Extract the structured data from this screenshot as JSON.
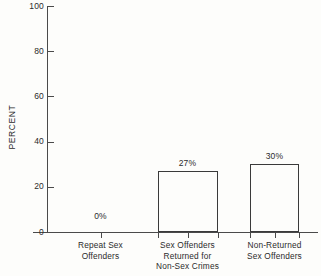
{
  "chart_data": {
    "type": "bar",
    "title": "",
    "subtitle": "",
    "xlabel": "",
    "ylabel": "PERCENT",
    "ylim": [
      0,
      100
    ],
    "yticks": [
      0,
      20,
      40,
      60,
      80,
      100
    ],
    "grid": false,
    "legend": false,
    "categories": [
      "Repeat Sex Offenders",
      "Sex Offenders Returned for Non-Sex Crimes",
      "Non-Returned Sex Offenders"
    ],
    "category_lines": [
      [
        "Repeat Sex",
        "Offenders"
      ],
      [
        "Sex Offenders",
        "Returned for",
        "Non-Sex Crimes"
      ],
      [
        "Non-Returned",
        "Sex Offenders"
      ]
    ],
    "values": [
      0,
      27,
      30
    ],
    "value_labels": [
      "0%",
      "27%",
      "30%"
    ],
    "bar_style": "unfilled-outline",
    "colors": {
      "background": "#fdfdfb",
      "axis": "#4a4a4a",
      "bar_outline": "#3a3a3a",
      "text": "#2b2b2b"
    }
  },
  "caption": {
    "text": ""
  }
}
